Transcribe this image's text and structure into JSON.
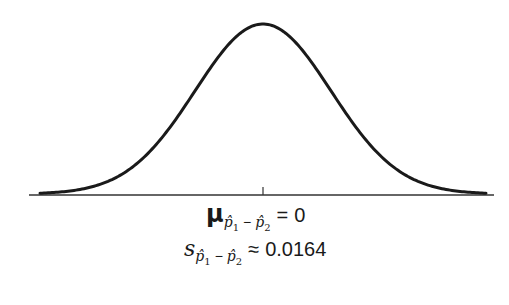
{
  "chart_data": {
    "type": "line",
    "title": "",
    "distribution": "normal",
    "mean": 0,
    "standard_error": 0.0164,
    "xlabel": "",
    "ylabel": "",
    "x_ticks": [
      "0"
    ],
    "grid": false,
    "legend": "none"
  },
  "labels": {
    "mean": {
      "symbol": "μ",
      "subscript_p1": "p̂",
      "subscript_idx1": "1",
      "subscript_minus": "−",
      "subscript_p2": "p̂",
      "subscript_idx2": "2",
      "relation": "=",
      "value": "0"
    },
    "sd": {
      "symbol": "s",
      "subscript_p1": "p̂",
      "subscript_idx1": "1",
      "subscript_minus": "−",
      "subscript_p2": "p̂",
      "subscript_idx2": "2",
      "relation": "≈",
      "value": "0.0164"
    }
  },
  "style": {
    "curve_color": "#1a1a1a",
    "axis_color": "#333333",
    "background": "#ffffff"
  }
}
